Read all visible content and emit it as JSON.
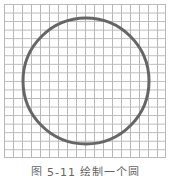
{
  "figure": {
    "grid": {
      "columns": 18,
      "rows": 18,
      "line_color": "#b9b9b9"
    },
    "circle": {
      "cx": 86,
      "cy": 81,
      "r": 63,
      "stroke_color": "#666666",
      "stroke_width": 3
    },
    "caption": "图 5-11 绘制一个圆"
  }
}
